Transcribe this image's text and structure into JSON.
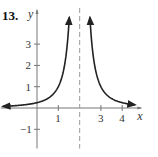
{
  "problem_number": "13.",
  "chart_data": {
    "type": "line",
    "title": "",
    "xlabel": "x",
    "ylabel": "y",
    "function": "y = 1/(x-2)^2",
    "x_ticks": [
      1,
      3,
      4
    ],
    "y_ticks": [
      -1,
      1,
      2,
      3
    ],
    "x_tick_labels": [
      "1",
      "3",
      "4"
    ],
    "y_tick_labels": [
      "-1",
      "1",
      "2",
      "3"
    ],
    "xlim": [
      -1.7,
      4.9
    ],
    "ylim": [
      -1.9,
      4.6
    ],
    "vertical_asymptote": 2,
    "asymptote_style": "dashed",
    "grid": false,
    "series": [
      {
        "name": "left branch",
        "x": [
          -1.6,
          -1,
          0,
          0.5,
          1,
          1.3,
          1.5,
          1.6,
          1.7
        ],
        "y": [
          0.08,
          0.11,
          0.25,
          0.44,
          1,
          2.04,
          4,
          6.25,
          11.1
        ]
      },
      {
        "name": "right branch",
        "x": [
          2.3,
          2.4,
          2.5,
          2.7,
          3,
          3.5,
          4,
          4.6
        ],
        "y": [
          11.1,
          6.25,
          4,
          2.04,
          1,
          0.44,
          0.25,
          0.15
        ]
      }
    ],
    "colors": {
      "curve": "#222222",
      "axes": "#777777",
      "asymptote": "#aaaaaa"
    }
  }
}
